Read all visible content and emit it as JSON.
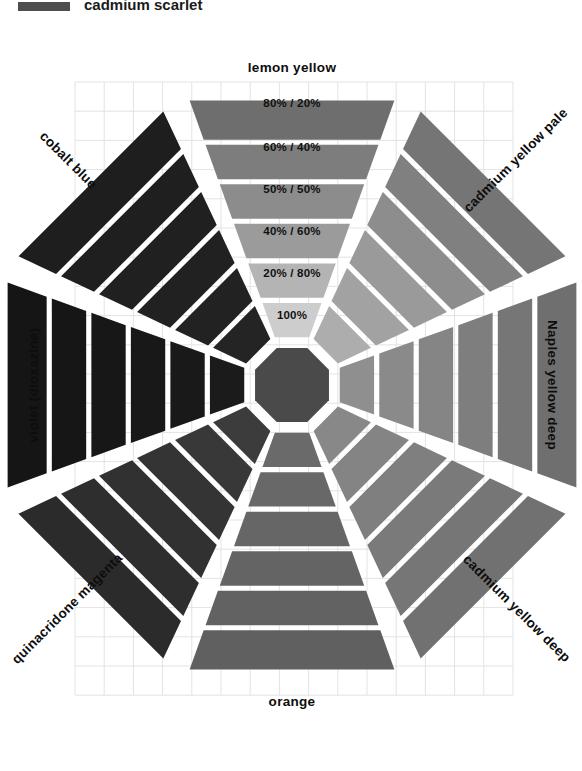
{
  "figure": {
    "background_color": "#ffffff",
    "grid_color": "#e3e3e3",
    "gap_color": "#ffffff",
    "center_swatch_color": "#4a4a4a"
  },
  "legend": {
    "swatch_color": "#4e4e4e",
    "label": "cadmium scarlet"
  },
  "grid": {
    "x": 75,
    "y": 82,
    "cols": 15,
    "rows": 21,
    "cell": 29.2,
    "visible": true
  },
  "ratio_labels": [
    "100%",
    "20% / 80%",
    "40% / 60%",
    "50% / 50%",
    "60% / 40%",
    "80% / 20%"
  ],
  "arms": [
    {
      "id": "lemon-yellow",
      "label": "lemon yellow",
      "angle_deg": 270,
      "label_position": "top",
      "label_rotation": 0,
      "shows_ratio_labels": true,
      "colors": [
        "#cdcdcd",
        "#b4b4b4",
        "#9b9b9b",
        "#8c8c8c",
        "#7d7d7d",
        "#6e6e6e"
      ]
    },
    {
      "id": "cadmium-yellow-pale",
      "label": "cadmium yellow pale",
      "angle_deg": 315,
      "label_position": "top-right",
      "label_rotation": -45,
      "shows_ratio_labels": false,
      "colors": [
        "#adadad",
        "#a2a2a2",
        "#9a9a9a",
        "#8d8d8d",
        "#808080",
        "#757575"
      ]
    },
    {
      "id": "naples-yellow-deep",
      "label": "Naples yellow deep",
      "angle_deg": 0,
      "label_position": "right",
      "label_rotation": 90,
      "shows_ratio_labels": false,
      "colors": [
        "#8f8f8f",
        "#8a8a8a",
        "#858585",
        "#7e7e7e",
        "#767676",
        "#6f6f6f"
      ]
    },
    {
      "id": "cadmium-yellow-deep",
      "label": "cadmium yellow deep",
      "angle_deg": 45,
      "label_position": "bottom-right",
      "label_rotation": 45,
      "shows_ratio_labels": false,
      "colors": [
        "#888888",
        "#848484",
        "#7f7f7f",
        "#7a7a7a",
        "#767676",
        "#717171"
      ]
    },
    {
      "id": "orange",
      "label": "orange",
      "angle_deg": 90,
      "label_position": "bottom",
      "label_rotation": 0,
      "shows_ratio_labels": false,
      "colors": [
        "#6a6a6a",
        "#686868",
        "#666666",
        "#646464",
        "#626262",
        "#606060"
      ]
    },
    {
      "id": "quinacridone-magenta",
      "label": "quinacridone magenta",
      "angle_deg": 135,
      "label_position": "bottom-left",
      "label_rotation": -45,
      "shows_ratio_labels": false,
      "colors": [
        "#3c3c3c",
        "#383838",
        "#343434",
        "#313131",
        "#2e2e2e",
        "#2b2b2b"
      ]
    },
    {
      "id": "violet-dioxazine",
      "label": "violet (dioxazine)",
      "angle_deg": 180,
      "label_position": "left",
      "label_rotation": -90,
      "shows_ratio_labels": false,
      "colors": [
        "#1b1b1b",
        "#191919",
        "#181818",
        "#171717",
        "#161616",
        "#151515"
      ]
    },
    {
      "id": "cobalt-blue",
      "label": "cobalt blue",
      "angle_deg": 225,
      "label_position": "top-left",
      "label_rotation": 45,
      "shows_ratio_labels": false,
      "colors": [
        "#242424",
        "#222222",
        "#212121",
        "#202020",
        "#1f1f1f",
        "#1e1e1e"
      ]
    }
  ],
  "geometry": {
    "center_x": 292,
    "center_y": 385,
    "inner_radius": 40,
    "ring_radii": [
      48,
      90,
      132,
      174,
      216,
      258,
      305
    ],
    "half_angle_deg": 20.5
  }
}
